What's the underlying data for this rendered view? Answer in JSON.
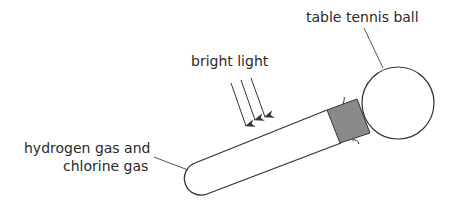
{
  "labels": {
    "ball": "table tennis ball",
    "light": "bright light",
    "gas_line1": "hydrogen gas and",
    "gas_line2": "chlorine gas"
  },
  "colors": {
    "stroke": "#333333",
    "stopper": "#8a8a8a"
  }
}
